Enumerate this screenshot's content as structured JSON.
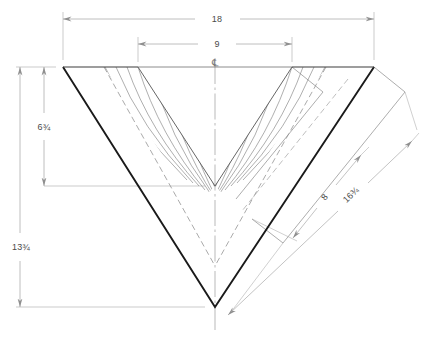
{
  "drawing": {
    "title": "V-Block Chevron Section Drawing",
    "type": "orthographic-section",
    "units": "inches"
  },
  "centerline": {
    "symbol": "℄",
    "name": "centerline"
  },
  "dimensions": {
    "overall_width": {
      "label": "18",
      "name": "overall-width",
      "orientation": "horizontal",
      "position": "top"
    },
    "inner_width": {
      "label": "9",
      "name": "inner-width",
      "orientation": "horizontal",
      "position": "top"
    },
    "inner_depth": {
      "label": "6¾",
      "name": "inner-depth",
      "orientation": "vertical",
      "position": "left"
    },
    "overall_depth": {
      "label": "13¾",
      "name": "overall-depth",
      "orientation": "vertical",
      "position": "left"
    },
    "inner_leg_length": {
      "label": "8",
      "name": "inner-leg-length",
      "orientation": "diagonal",
      "position": "right"
    },
    "outer_leg_length": {
      "label": "16¾",
      "name": "outer-leg-length",
      "orientation": "diagonal",
      "position": "right"
    }
  },
  "colors": {
    "outline": "#1a1a1a",
    "thin_line": "#6e6e6e",
    "dim_line": "#9a9a9a",
    "hatch": "#7a7a7a",
    "hidden_line": "#8d8d8d",
    "text": "#4a4a4a",
    "background": "#ffffff"
  },
  "geometry": {
    "apex_outer": {
      "x": 215,
      "y": 307
    },
    "apex_inner": {
      "x": 215,
      "y": 186
    },
    "top_left": {
      "x": 63,
      "y": 67
    },
    "top_right": {
      "x": 374,
      "y": 67
    },
    "inner_top_left": {
      "x": 138,
      "y": 67
    },
    "inner_top_right": {
      "x": 292,
      "y": 67
    }
  }
}
